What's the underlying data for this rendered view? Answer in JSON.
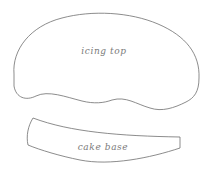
{
  "diagram": {
    "shapes": [
      {
        "id": "icing-top",
        "label": "icing top"
      },
      {
        "id": "cake-base",
        "label": "cake base"
      }
    ],
    "colors": {
      "stroke": "#6e6e6e",
      "text": "#7a7a7a",
      "background": "#ffffff"
    }
  }
}
